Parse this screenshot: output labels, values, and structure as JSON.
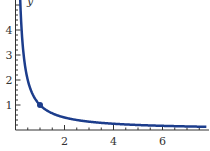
{
  "chart_data": {
    "type": "line",
    "title": "",
    "xlabel": "",
    "ylabel": "y",
    "function": "y = 1/x",
    "series": [
      {
        "name": "y = 1/x",
        "color": "#1c3d8c",
        "x": [
          0.2,
          0.25,
          0.3,
          0.4,
          0.5,
          0.75,
          1,
          1.5,
          2,
          3,
          4,
          5,
          6,
          7,
          7.8
        ],
        "values": [
          5,
          4,
          3.333,
          2.5,
          2,
          1.333,
          1,
          0.667,
          0.5,
          0.333,
          0.25,
          0.2,
          0.167,
          0.143,
          0.128
        ]
      }
    ],
    "highlight_point": {
      "x": 1,
      "y": 1
    },
    "x_ticks": [
      "2",
      "4",
      "6"
    ],
    "y_ticks": [
      "1",
      "2",
      "3",
      "4"
    ],
    "xlim": [
      0,
      7.8
    ],
    "ylim": [
      0,
      5
    ],
    "grid": false,
    "legend": null
  },
  "axes": {
    "x_tick_labels": [
      "2",
      "4",
      "6"
    ],
    "y_tick_labels": [
      "1",
      "2",
      "3",
      "4"
    ],
    "y_axis_label": "y"
  }
}
